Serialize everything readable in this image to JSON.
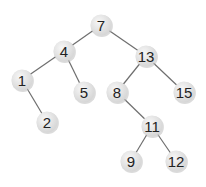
{
  "diagram": {
    "type": "binary-search-tree",
    "node_radius": 10.5,
    "colors": {
      "background": "#ffffff",
      "node_fill_light": "#f7f7f7",
      "node_fill_dark": "#d4d4d4",
      "node_shadow": "#bdbdbd",
      "edge": "#6e6e6e",
      "label": "#222222"
    },
    "nodes": [
      {
        "id": "n7",
        "label": "7",
        "x": 101,
        "y": 25
      },
      {
        "id": "n4",
        "label": "4",
        "x": 64,
        "y": 51
      },
      {
        "id": "n13",
        "label": "13",
        "x": 146,
        "y": 56
      },
      {
        "id": "n1",
        "label": "1",
        "x": 22,
        "y": 80
      },
      {
        "id": "n5",
        "label": "5",
        "x": 84,
        "y": 92
      },
      {
        "id": "n8",
        "label": "8",
        "x": 117,
        "y": 92
      },
      {
        "id": "n15",
        "label": "15",
        "x": 184,
        "y": 92
      },
      {
        "id": "n2",
        "label": "2",
        "x": 47,
        "y": 122
      },
      {
        "id": "n11",
        "label": "11",
        "x": 152,
        "y": 126
      },
      {
        "id": "n9",
        "label": "9",
        "x": 131,
        "y": 161
      },
      {
        "id": "n12",
        "label": "12",
        "x": 176,
        "y": 161
      }
    ],
    "edges": [
      {
        "from": "n7",
        "to": "n4"
      },
      {
        "from": "n7",
        "to": "n13"
      },
      {
        "from": "n4",
        "to": "n1"
      },
      {
        "from": "n4",
        "to": "n5"
      },
      {
        "from": "n1",
        "to": "n2"
      },
      {
        "from": "n13",
        "to": "n8"
      },
      {
        "from": "n13",
        "to": "n15"
      },
      {
        "from": "n8",
        "to": "n11"
      },
      {
        "from": "n11",
        "to": "n9"
      },
      {
        "from": "n11",
        "to": "n12"
      }
    ]
  }
}
